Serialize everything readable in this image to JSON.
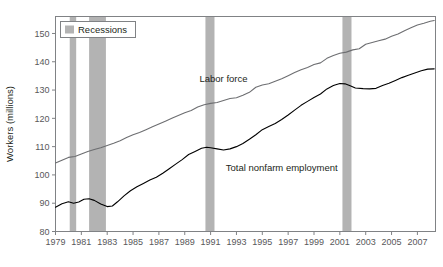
{
  "chart_data": {
    "type": "line",
    "title": "",
    "xlabel": "",
    "ylabel": "Workers (millions)",
    "xlim": [
      1979,
      2008.4
    ],
    "ylim": [
      80,
      156
    ],
    "grid": false,
    "legend_position": "top-left",
    "legend_entries": [
      "Recessions"
    ],
    "xtick_labels": [
      "1979",
      "1981",
      "1983",
      "1985",
      "1987",
      "1989",
      "1991",
      "1993",
      "1995",
      "1997",
      "1999",
      "2001",
      "2003",
      "2005",
      "2007"
    ],
    "xticks": [
      1979,
      1981,
      1983,
      1985,
      1987,
      1989,
      1991,
      1993,
      1995,
      1997,
      1999,
      2001,
      2003,
      2005,
      2007
    ],
    "ytick_labels": [
      "80",
      "90",
      "100",
      "110",
      "120",
      "130",
      "140",
      "150"
    ],
    "yticks": [
      80,
      90,
      100,
      110,
      120,
      130,
      140,
      150
    ],
    "annotations": [
      {
        "text": "Labor force",
        "x": 1992.0,
        "y": 133.0
      },
      {
        "text": "Total nonfarm employment",
        "x": 1996.5,
        "y": 101.5
      }
    ],
    "shaded_regions": [
      {
        "label": "Recession",
        "x0": 1980.1,
        "x1": 1980.6
      },
      {
        "label": "Recession",
        "x0": 1981.6,
        "x1": 1982.9
      },
      {
        "label": "Recession",
        "x0": 1990.6,
        "x1": 1991.3
      },
      {
        "label": "Recession",
        "x0": 2001.2,
        "x1": 2001.9
      }
    ],
    "series": [
      {
        "name": "Labor force",
        "color": "#6d6e71",
        "x": [
          1979.0,
          1979.5,
          1980.0,
          1980.5,
          1981.0,
          1981.5,
          1982.0,
          1982.5,
          1983.0,
          1983.5,
          1984.0,
          1984.5,
          1985.0,
          1985.5,
          1986.0,
          1986.5,
          1987.0,
          1987.5,
          1988.0,
          1988.5,
          1989.0,
          1989.5,
          1990.0,
          1990.5,
          1991.0,
          1991.5,
          1992.0,
          1992.5,
          1993.0,
          1993.5,
          1994.0,
          1994.5,
          1995.0,
          1995.5,
          1996.0,
          1996.5,
          1997.0,
          1997.5,
          1998.0,
          1998.5,
          1999.0,
          1999.5,
          2000.0,
          2000.5,
          2001.0,
          2001.5,
          2002.0,
          2002.5,
          2003.0,
          2003.5,
          2004.0,
          2004.5,
          2005.0,
          2005.5,
          2006.0,
          2006.5,
          2007.0,
          2007.5,
          2008.0,
          2008.3
        ],
        "y": [
          104.2,
          105.2,
          106.2,
          106.5,
          107.4,
          108.3,
          109.0,
          109.6,
          110.4,
          111.2,
          112.1,
          113.2,
          114.2,
          115.0,
          116.0,
          117.0,
          118.0,
          119.0,
          120.0,
          121.0,
          122.0,
          122.8,
          124.0,
          124.8,
          125.3,
          125.6,
          126.3,
          127.0,
          127.3,
          128.2,
          129.2,
          131.0,
          131.8,
          132.2,
          133.1,
          134.0,
          135.1,
          136.2,
          137.2,
          138.0,
          139.0,
          139.6,
          141.2,
          142.2,
          143.0,
          143.4,
          144.2,
          144.6,
          146.2,
          146.8,
          147.4,
          148.0,
          149.0,
          149.8,
          151.0,
          152.0,
          153.0,
          153.6,
          154.3,
          154.6
        ]
      },
      {
        "name": "Total nonfarm employment",
        "color": "#000000",
        "x": [
          1979.0,
          1979.5,
          1980.0,
          1980.4,
          1980.8,
          1981.2,
          1981.6,
          1982.0,
          1982.5,
          1983.0,
          1983.4,
          1983.8,
          1984.3,
          1984.8,
          1985.3,
          1985.8,
          1986.3,
          1986.8,
          1987.3,
          1987.8,
          1988.3,
          1988.8,
          1989.3,
          1989.8,
          1990.3,
          1990.7,
          1991.0,
          1991.5,
          1992.0,
          1992.5,
          1993.0,
          1993.5,
          1994.0,
          1994.5,
          1995.0,
          1995.5,
          1996.0,
          1996.5,
          1997.0,
          1997.5,
          1998.0,
          1998.5,
          1999.0,
          1999.5,
          2000.0,
          2000.5,
          2001.0,
          2001.4,
          2001.8,
          2002.2,
          2002.8,
          2003.3,
          2003.8,
          2004.3,
          2004.8,
          2005.3,
          2005.8,
          2006.3,
          2006.8,
          2007.3,
          2007.8,
          2008.3
        ],
        "y": [
          88.6,
          89.8,
          90.5,
          90.0,
          90.4,
          91.4,
          91.6,
          91.0,
          89.7,
          88.8,
          89.0,
          90.5,
          92.6,
          94.4,
          95.8,
          97.0,
          98.2,
          99.2,
          100.6,
          102.2,
          103.8,
          105.4,
          107.2,
          108.3,
          109.4,
          109.8,
          109.6,
          109.2,
          108.8,
          109.2,
          110.0,
          111.1,
          112.6,
          114.2,
          116.0,
          117.1,
          118.2,
          119.6,
          121.2,
          122.9,
          124.6,
          126.0,
          127.4,
          128.6,
          130.4,
          131.6,
          132.3,
          132.2,
          131.5,
          130.7,
          130.5,
          130.4,
          130.6,
          131.6,
          132.4,
          133.4,
          134.4,
          135.2,
          136.0,
          136.8,
          137.4,
          137.5
        ]
      }
    ]
  },
  "legend": {
    "label": "Recessions",
    "swatch_color": "#b3b3b3"
  },
  "style": {
    "axis_color": "#808285",
    "recession_color": "#b3b3b3"
  }
}
